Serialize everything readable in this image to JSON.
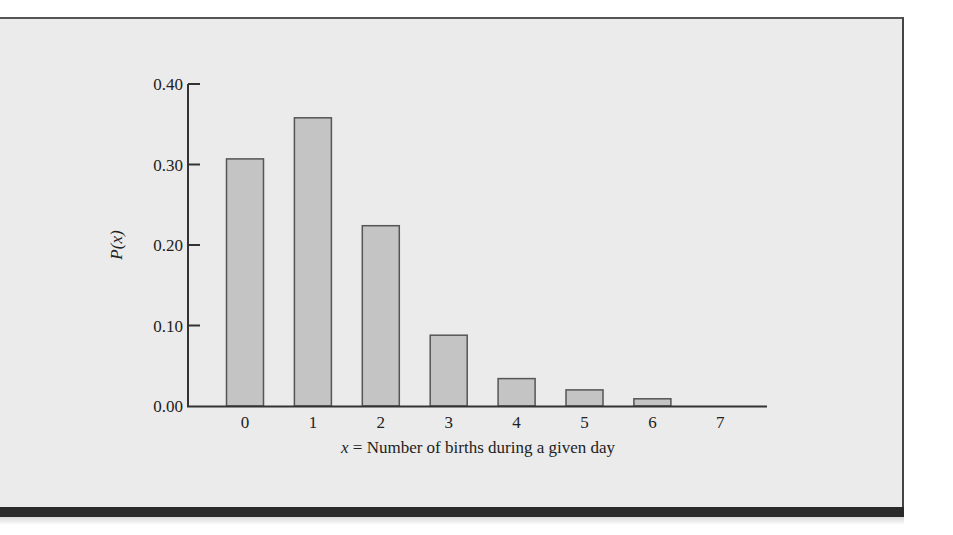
{
  "chart_data": {
    "type": "bar",
    "title": "",
    "xlabel": "x = Number of births during a given day",
    "xlabel_var": "x",
    "xlabel_rest": " = Number of births during a given day",
    "ylabel": "P(x)",
    "categories": [
      "0",
      "1",
      "2",
      "3",
      "4",
      "5",
      "6",
      "7"
    ],
    "values": [
      0.307,
      0.358,
      0.224,
      0.088,
      0.034,
      0.02,
      0.009,
      0.001
    ],
    "ylim": [
      0,
      0.4
    ],
    "yticks": [
      "0.00",
      "0.10",
      "0.20",
      "0.30",
      "0.40"
    ],
    "ytick_values": [
      0,
      0.1,
      0.2,
      0.3,
      0.4
    ],
    "grid": false,
    "legend": null
  },
  "colors": {
    "panel_bg": "#ebebeb",
    "bar_fill": "#c4c4c4",
    "bar_stroke": "#555555",
    "axis": "#333333",
    "bottom_bar": "#2a2a2a"
  }
}
